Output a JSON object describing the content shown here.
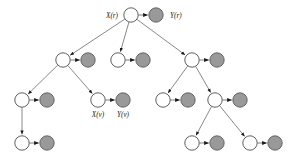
{
  "diagram": {
    "type": "directed-tree",
    "colors": {
      "hidden_node_fill": "#ffffff",
      "observed_node_fill": "#999999",
      "node_stroke": "#4d4d4d",
      "edge_stroke": "#7a7a7a",
      "arrow_fill": "#1a1a1a",
      "label_color": "#1a1a1a",
      "background": "#ffffff"
    },
    "geometry": {
      "width": 296,
      "height": 162,
      "hidden_radius": 7.2,
      "observed_radius": 7.2
    },
    "hidden_nodes": [
      {
        "id": "h_root",
        "cx": 131,
        "cy": 15,
        "label": "X(r)",
        "label_dx": -13,
        "label_dy": 2
      },
      {
        "id": "h_l1",
        "cx": 63,
        "cy": 60,
        "label": "",
        "label_dx": 0,
        "label_dy": 0
      },
      {
        "id": "h_m1",
        "cx": 118,
        "cy": 60,
        "label": "",
        "label_dx": 0,
        "label_dy": 0
      },
      {
        "id": "h_r1",
        "cx": 192,
        "cy": 60,
        "label": "",
        "label_dx": 0,
        "label_dy": 0
      },
      {
        "id": "h_l2a",
        "cx": 22,
        "cy": 100,
        "label": "",
        "label_dx": 0,
        "label_dy": 0
      },
      {
        "id": "h_l2b",
        "cx": 98,
        "cy": 100,
        "label": "X(v)",
        "label_dx": 0,
        "label_dy": 17
      },
      {
        "id": "h_r2a",
        "cx": 163,
        "cy": 100,
        "label": "",
        "label_dx": 0,
        "label_dy": 0
      },
      {
        "id": "h_r2b",
        "cx": 215,
        "cy": 100,
        "label": "",
        "label_dx": 0,
        "label_dy": 0
      },
      {
        "id": "h_l3",
        "cx": 22,
        "cy": 143,
        "label": "",
        "label_dx": 0,
        "label_dy": 0
      },
      {
        "id": "h_r3a",
        "cx": 192,
        "cy": 143,
        "label": "",
        "label_dx": 0,
        "label_dy": 0
      },
      {
        "id": "h_r3b",
        "cx": 250,
        "cy": 143,
        "label": "",
        "label_dx": 0,
        "label_dy": 0
      }
    ],
    "observed_nodes": [
      {
        "id": "o_root",
        "cx": 156,
        "cy": 15,
        "label": "Y(r)",
        "label_dx": 14,
        "label_dy": 2
      },
      {
        "id": "o_l1",
        "cx": 88,
        "cy": 60,
        "label": "",
        "label_dx": 0,
        "label_dy": 0
      },
      {
        "id": "o_m1",
        "cx": 143,
        "cy": 60,
        "label": "",
        "label_dx": 0,
        "label_dy": 0
      },
      {
        "id": "o_r1",
        "cx": 217,
        "cy": 60,
        "label": "",
        "label_dx": 0,
        "label_dy": 0
      },
      {
        "id": "o_l2a",
        "cx": 47,
        "cy": 100,
        "label": "",
        "label_dx": 0,
        "label_dy": 0
      },
      {
        "id": "o_l2b",
        "cx": 123,
        "cy": 100,
        "label": "Y(v)",
        "label_dx": 0,
        "label_dy": 17
      },
      {
        "id": "o_r2a",
        "cx": 188,
        "cy": 100,
        "label": "",
        "label_dx": 0,
        "label_dy": 0
      },
      {
        "id": "o_r2b",
        "cx": 240,
        "cy": 100,
        "label": "",
        "label_dx": 0,
        "label_dy": 0
      },
      {
        "id": "o_l3",
        "cx": 47,
        "cy": 143,
        "label": "",
        "label_dx": 0,
        "label_dy": 0
      },
      {
        "id": "o_r3a",
        "cx": 217,
        "cy": 143,
        "label": "",
        "label_dx": 0,
        "label_dy": 0
      },
      {
        "id": "o_r3b",
        "cx": 275,
        "cy": 143,
        "label": "",
        "label_dx": 0,
        "label_dy": 0
      }
    ],
    "emission_edges": [
      {
        "from": "h_root",
        "to": "o_root"
      },
      {
        "from": "h_l1",
        "to": "o_l1"
      },
      {
        "from": "h_m1",
        "to": "o_m1"
      },
      {
        "from": "h_r1",
        "to": "o_r1"
      },
      {
        "from": "h_l2a",
        "to": "o_l2a"
      },
      {
        "from": "h_l2b",
        "to": "o_l2b"
      },
      {
        "from": "h_r2a",
        "to": "o_r2a"
      },
      {
        "from": "h_r2b",
        "to": "o_r2b"
      },
      {
        "from": "h_l3",
        "to": "o_l3"
      },
      {
        "from": "h_r3a",
        "to": "o_r3a"
      },
      {
        "from": "h_r3b",
        "to": "o_r3b"
      }
    ],
    "transition_edges": [
      {
        "from": "h_root",
        "to": "h_l1"
      },
      {
        "from": "h_root",
        "to": "h_m1"
      },
      {
        "from": "h_root",
        "to": "h_r1"
      },
      {
        "from": "h_l1",
        "to": "h_l2a"
      },
      {
        "from": "h_l1",
        "to": "h_l2b"
      },
      {
        "from": "h_r1",
        "to": "h_r2a"
      },
      {
        "from": "h_r1",
        "to": "h_r2b"
      },
      {
        "from": "h_l2a",
        "to": "h_l3"
      },
      {
        "from": "h_r2b",
        "to": "h_r3a"
      },
      {
        "from": "h_r2b",
        "to": "h_r3b"
      }
    ],
    "labels": [
      {
        "id": "label-x-r",
        "text": "X(r)",
        "x": 118,
        "y": 17.5,
        "anchor": "end"
      },
      {
        "id": "label-y-r",
        "text": "Y(r)",
        "x": 170,
        "y": 17.5,
        "anchor": "start"
      },
      {
        "id": "label-x-v",
        "text": "X(v)",
        "x": 98,
        "y": 117,
        "anchor": "middle"
      },
      {
        "id": "label-y-v",
        "text": "Y(v)",
        "x": 123,
        "y": 117,
        "anchor": "middle"
      }
    ]
  }
}
